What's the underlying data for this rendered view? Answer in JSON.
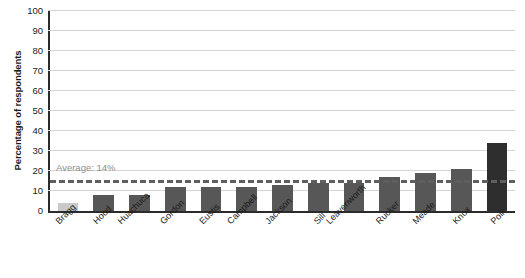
{
  "chart_data": {
    "type": "bar",
    "title": "",
    "xlabel": "",
    "ylabel": "Percentage of respondents",
    "ylim": [
      0,
      100
    ],
    "ytick_step": 10,
    "yticks": [
      100,
      90,
      80,
      70,
      60,
      50,
      40,
      30,
      20,
      10,
      0
    ],
    "grid": true,
    "legend": "none",
    "categories": [
      "Bragg",
      "Hood",
      "Huachuca",
      "Gordon",
      "Eustis",
      "Campbell",
      "Jackson",
      "Sill",
      "Leavenworth",
      "Rucker",
      "Meade",
      "Knox",
      "Polk"
    ],
    "values": [
      4,
      8,
      8,
      12,
      12,
      12,
      13,
      14,
      14,
      17,
      19,
      21,
      34
    ],
    "bar_colors": [
      "#c9c9c9",
      "#575757",
      "#575757",
      "#575757",
      "#575757",
      "#575757",
      "#575757",
      "#575757",
      "#575757",
      "#575757",
      "#575757",
      "#575757",
      "#2e2e2e"
    ],
    "annotations": [
      {
        "name": "average-line",
        "label": "Average: 14%",
        "value": 14,
        "style": "dashed",
        "color": "#5f5f5f"
      }
    ]
  },
  "colors": {
    "axis": "#2b2b2b",
    "grid": "#d5d5d5",
    "bar_default": "#575757",
    "bar_first": "#c9c9c9",
    "bar_last": "#2e2e2e",
    "avg_line": "#5f5f5f",
    "avg_label_text": "#8d8d8d",
    "background": "#ffffff"
  }
}
